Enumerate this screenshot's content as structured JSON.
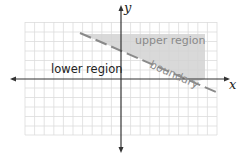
{
  "diagram": {
    "axes": {
      "x_label": "x",
      "y_label": "y"
    },
    "labels": {
      "lower": "lower region",
      "upper": "upper region",
      "boundary": "boundary"
    },
    "colors": {
      "grid": "#d9d9d9",
      "axis": "#333333",
      "shade": "#d6d6d6",
      "boundary_line": "#888888",
      "text_dark": "#222222",
      "text_light": "#8a8a8a"
    }
  }
}
